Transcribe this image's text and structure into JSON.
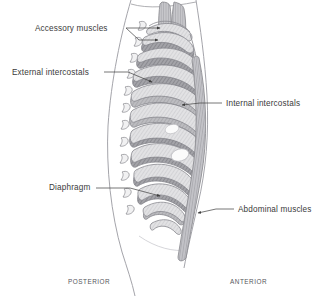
{
  "figure": {
    "type": "anatomical-diagram",
    "background_color": "#ffffff",
    "outline_color": "#8e8e93",
    "rib_fill": "#ededee",
    "intercostal_fill": "#9d9da2",
    "muscle_fill": "#b4b4b8",
    "label_color": "#3a3a3a",
    "orientation_label_color": "#55555a",
    "leader_color": "#4a4a4a"
  },
  "labels": {
    "accessory_muscles": "Accessory muscles",
    "external_intercostals": "External intercostals",
    "internal_intercostals": "Internal intercostals",
    "diaphragm": "Diaphragm",
    "abdominal_muscles": "Abdominal muscles"
  },
  "orientation": {
    "posterior": "POSTERIOR",
    "anterior": "ANTERIOR"
  },
  "structures": [
    {
      "name": "accessory-muscles",
      "count": 2,
      "description": "two elongated vertical muscle straps above the thoracic cage"
    },
    {
      "name": "external-intercostals",
      "description": "hatched bands in the upper posterior intercostal spaces"
    },
    {
      "name": "internal-intercostals",
      "description": "hatched bands in the upper anterior intercostal spaces"
    },
    {
      "name": "diaphragm",
      "description": "dome beneath the lower ribs in the posterior-inferior thorax"
    },
    {
      "name": "abdominal-muscles",
      "description": "long striated band descending along the anterior wall"
    },
    {
      "name": "ribs",
      "count": 12,
      "description": "stacked curved rib bands forming the thoracic cage"
    },
    {
      "name": "vertebral-spinous-processes",
      "count": 12,
      "description": "small hook shapes along the posterior spine"
    },
    {
      "name": "body-outline",
      "description": "posterior and anterior torso contour lines"
    }
  ]
}
